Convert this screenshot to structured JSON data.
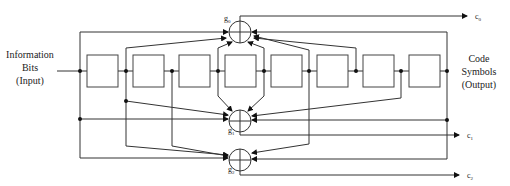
{
  "input_label": [
    "Information",
    "Bits",
    "(Input)"
  ],
  "output_label": [
    "Code",
    "Symbols",
    "(Output)"
  ],
  "registers": {
    "count": 8
  },
  "adders": [
    {
      "id": "g0",
      "label": "g",
      "sub": "0",
      "output": "c",
      "output_sub": "0"
    },
    {
      "id": "g1",
      "label": "g",
      "sub": "1",
      "output": "c",
      "output_sub": "1"
    },
    {
      "id": "g2",
      "label": "g",
      "sub": "2",
      "output": "c",
      "output_sub": "2"
    }
  ],
  "icons": {
    "adder": "xor-circle-icon",
    "tap": "junction-dot-icon",
    "flow": "arrowhead-icon"
  }
}
